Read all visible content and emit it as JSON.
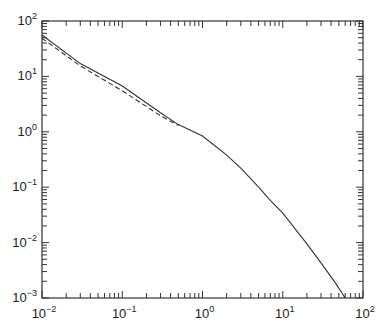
{
  "chart_data": {
    "type": "line",
    "title": "",
    "xlabel": "",
    "ylabel": "",
    "xscale": "log",
    "yscale": "log",
    "xlim": [
      0.01,
      100
    ],
    "ylim": [
      0.001,
      100
    ],
    "grid": false,
    "legend": null,
    "x_ticks": [
      "10^-2",
      "10^-1",
      "10^0",
      "10^1",
      "10^2"
    ],
    "y_ticks": [
      "10^-3",
      "10^-2",
      "10^-1",
      "10^0",
      "10^1",
      "10^2"
    ],
    "series": [
      {
        "name": "solid",
        "style": "solid",
        "color": "#333333",
        "x": [
          0.01,
          0.03,
          0.1,
          0.3,
          0.5,
          1,
          2,
          3,
          5,
          7,
          10,
          20,
          30,
          45,
          60
        ],
        "y": [
          56,
          17,
          6.7,
          2.2,
          1.35,
          0.84,
          0.38,
          0.22,
          0.1,
          0.058,
          0.034,
          0.0095,
          0.0043,
          0.0019,
          0.001
        ]
      },
      {
        "name": "dashed",
        "style": "dashed",
        "color": "#333333",
        "x": [
          0.01,
          0.03,
          0.1,
          0.3,
          0.5
        ],
        "y": [
          49,
          15.5,
          5.5,
          1.95,
          1.3
        ]
      }
    ]
  }
}
